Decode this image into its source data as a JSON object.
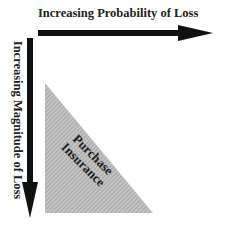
{
  "diagram": {
    "x_axis_label": "Increasing Probability of Loss",
    "y_axis_label": "Increasing Magnitude of Loss",
    "region": {
      "line1": "Purchase",
      "line2": "Insurance",
      "fill": "hatched-gray"
    },
    "colors": {
      "arrow": "#111111",
      "triangle_fill": "#bdbdbd",
      "hatch": "#8a8a8a",
      "text": "#222222"
    }
  }
}
